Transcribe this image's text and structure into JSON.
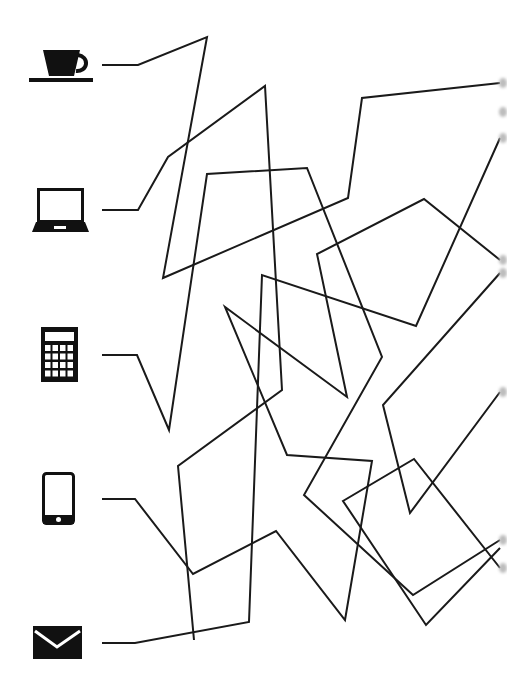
{
  "puzzle": {
    "type": "tangled-lines-matching",
    "line_color": "#1a1a1a",
    "background": "#ffffff",
    "icons": [
      {
        "name": "coffee-cup-icon",
        "label": "coffee cup",
        "y": 65
      },
      {
        "name": "laptop-icon",
        "label": "laptop",
        "y": 210
      },
      {
        "name": "calculator-icon",
        "label": "calculator",
        "y": 355
      },
      {
        "name": "tablet-icon",
        "label": "tablet",
        "y": 499
      },
      {
        "name": "envelope-icon",
        "label": "envelope",
        "y": 643
      }
    ],
    "paths": [
      {
        "from": "coffee-cup",
        "points": "102,65 138,65 207,37 163,278 348,198 362,98 500,83"
      },
      {
        "from": "laptop",
        "points": "102,210 138,210 168,157 265,86 282,390 178,466 194,640"
      },
      {
        "from": "calculator",
        "points": "102,355 137,355 169,430 207,174 307,168 382,357 304,495 413,595 500,540"
      },
      {
        "from": "tablet",
        "points": "102,499 135,499 193,574 276,531 345,620 372,461 287,455 225,307 347,397 317,254 424,199 500,260"
      },
      {
        "from": "envelope",
        "points": "102,643 135,643 249,622 262,275 416,326 500,138"
      },
      {
        "from": "right-a",
        "points": "500,273 383,405 410,513 500,392"
      },
      {
        "from": "right-b",
        "points": "500,568 414,459 343,501 426,625 500,548"
      },
      {
        "from": "right-c",
        "points": "500,112 500,112"
      }
    ],
    "right_endpoints_y": [
      83,
      112,
      138,
      260,
      273,
      392,
      540,
      568
    ]
  }
}
